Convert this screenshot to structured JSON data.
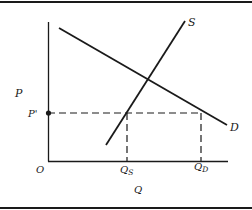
{
  "diagram": {
    "axes": {
      "y_label": "P",
      "x_label": "Q",
      "origin_label": "O"
    },
    "curves": [
      {
        "name": "demand",
        "label": "D"
      },
      {
        "name": "supply",
        "label": "S"
      }
    ],
    "markers": {
      "price_level_label": "P'",
      "quantity_supplied_label": "Q",
      "quantity_supplied_sub": "S",
      "quantity_demanded_label": "Q",
      "quantity_demanded_sub": "D"
    },
    "colors": {
      "line": "#1a1a1a",
      "background": "#ffffff"
    }
  }
}
